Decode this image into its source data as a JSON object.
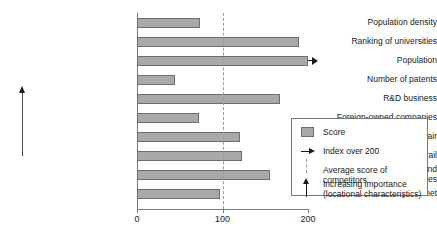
{
  "chart_data": {
    "type": "bar",
    "orientation": "horizontal",
    "title": "",
    "xlabel": "",
    "ylabel": "",
    "xlim": [
      0,
      200
    ],
    "xticks": [
      0,
      100,
      200
    ],
    "xtick_labels": [
      "0",
      "100",
      "200"
    ],
    "grid": false,
    "categories": [
      "Population density",
      "Ranking of universities",
      "Population",
      "Number of patents",
      "R&D business",
      "Foreign-owned companies",
      "Connectivity by air",
      "Connectivity by road and rail",
      "Concentration of financial and\nbusiness services",
      "Connectivity internet"
    ],
    "series": [
      {
        "name": "Score",
        "values": [
          74,
          190,
          200,
          45,
          167,
          73,
          120,
          123,
          155,
          97
        ]
      }
    ],
    "capped_categories": [
      "Population"
    ],
    "reference_line": {
      "label": "Average score of competitors",
      "value": 100,
      "style": "dashed"
    },
    "annotations": {
      "importance_axis": "Increasing importance (locational characteristics)"
    },
    "legend_position": "bottom-right",
    "legend_entries": [
      {
        "label": "Score",
        "marker": "swatch"
      },
      {
        "label": "Index over 200",
        "marker": "arrow-right"
      },
      {
        "label": "Average score of competitors",
        "marker": "dashed-line"
      },
      {
        "label": "Increasing importance\n(locational characteristics)",
        "marker": "arrow-up"
      }
    ],
    "colors": {
      "bar_fill": "#a9a9a9",
      "bar_border": "#6e6e6e",
      "axis": "#7a7a7a",
      "reference_line": "#9a9a9a",
      "text": "#1a1a1a"
    }
  }
}
